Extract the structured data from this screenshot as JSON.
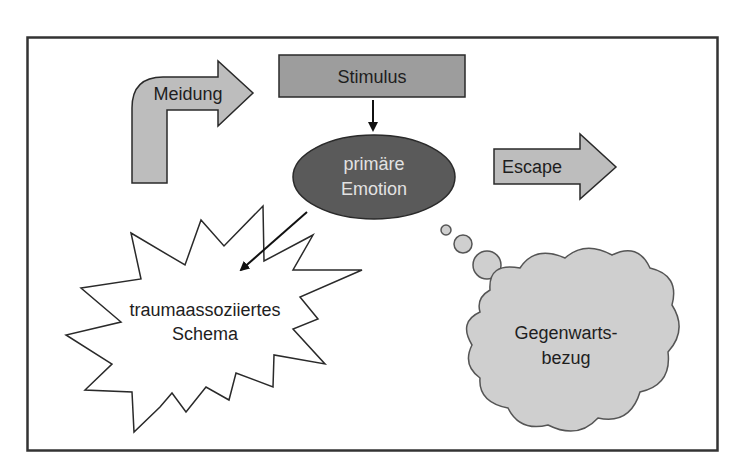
{
  "diagram": {
    "nodes": {
      "meidung": {
        "label": "Meidung",
        "shape": "bent-arrow"
      },
      "stimulus": {
        "label": "Stimulus",
        "shape": "rectangle"
      },
      "emotion": {
        "line1": "primäre",
        "line2": "Emotion",
        "shape": "ellipse"
      },
      "escape": {
        "label": "Escape",
        "shape": "right-arrow"
      },
      "schema": {
        "line1": "traumaassoziiertes",
        "line2": "Schema",
        "shape": "starburst"
      },
      "gegenwart": {
        "line1": "Gegenwarts-",
        "line2": "bezug",
        "shape": "thought-cloud"
      }
    },
    "edges": [
      {
        "from": "stimulus",
        "to": "emotion"
      },
      {
        "from": "emotion",
        "to": "schema"
      },
      {
        "from": "emotion",
        "to": "gegenwart",
        "style": "thought-bubbles"
      }
    ],
    "colors": {
      "frame": "#333333",
      "arrow_fill": "#bdbdbd",
      "stimulus_fill": "#9d9d9d",
      "emotion_fill": "#5a5a5a",
      "emotion_text": "#e2e2e2",
      "cloud_fill": "#cfcfcf",
      "outline": "#2a2a2a"
    }
  }
}
